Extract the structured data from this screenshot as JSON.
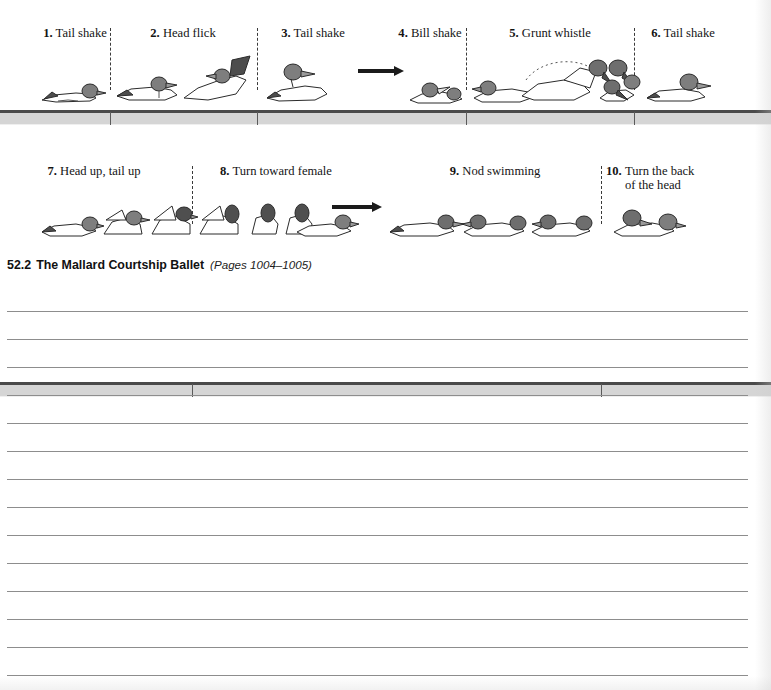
{
  "document": {
    "type": "textbook-worksheet-page",
    "caption": {
      "number": "52.2",
      "title": "The Mallard Courtship Ballet",
      "pages": "(Pages 1004–1005)"
    }
  },
  "figure": {
    "title": "The Mallard Courtship Ballet",
    "rows": [
      {
        "id": "row-1",
        "steps": [
          {
            "num": "1.",
            "label": "Tail shake",
            "x": 36,
            "y": 30,
            "width": 78
          },
          {
            "num": "2.",
            "label": "Head flick",
            "x": 143,
            "y": 30,
            "width": 78
          },
          {
            "num": "3.",
            "label": "Tail shake",
            "x": 273,
            "y": 30,
            "width": 78
          },
          {
            "num": "4.",
            "label": "Bill shake",
            "x": 390,
            "y": 30,
            "width": 78
          },
          {
            "num": "5.",
            "label": "Grunt whistle",
            "x": 508,
            "y": 30,
            "width": 96
          },
          {
            "num": "6.",
            "label": "Tail shake",
            "x": 643,
            "y": 30,
            "width": 78
          }
        ],
        "separators": [
          110,
          257,
          466,
          634
        ]
      },
      {
        "id": "row-2",
        "steps": [
          {
            "num": "7.",
            "label": "Head up, tail up",
            "x": 68,
            "y": 8,
            "width": 112
          },
          {
            "num": "8.",
            "label": "Turn toward female",
            "x": 210,
            "y": 8,
            "width": 132
          },
          {
            "num": "9.",
            "label": "Nod swimming",
            "x": 440,
            "y": 8,
            "width": 108
          },
          {
            "num": "10.",
            "label": "Turn the back\nof the head",
            "x": 608,
            "y": 8,
            "width": 112
          }
        ],
        "separators": [
          192,
          601
        ]
      }
    ],
    "arrows": [
      {
        "row": 1,
        "x": 358,
        "y": 66,
        "length": 44
      },
      {
        "row": 2,
        "x": 332,
        "y": 204,
        "length": 48
      }
    ],
    "waterline_color": "#4a4a4a",
    "water_fill_color": "#d5d5d5"
  },
  "notes": {
    "line_count": 14,
    "first_line_y": 311,
    "line_spacing": 28,
    "line_color": "#8d8d8d",
    "left": 7,
    "width": 741
  }
}
